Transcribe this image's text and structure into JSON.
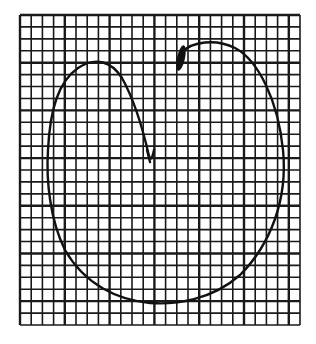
{
  "figure": {
    "type": "hand-drawn closed loop on grid paper",
    "background_color": "#ffffff",
    "ink_color": "#111111",
    "grid_color": "#1a1a1a"
  },
  "grid": {
    "left": 20,
    "top": 15,
    "right": 300,
    "bottom": 325,
    "columns": 25,
    "rows": 26,
    "line_width": 1.6,
    "heavy_line_width": 2.4,
    "heavy_every": 4
  },
  "curve": {
    "stroke_width": 2.4,
    "start_blot": {
      "x": 181,
      "y": 58,
      "rx": 4,
      "ry": 13
    },
    "end_mark": {
      "x": 149,
      "y": 158
    },
    "path": "M 182 52 C 192 42, 215 38, 235 48 C 258 60, 278 100, 283 150 C 288 200, 270 245, 240 275 C 212 300, 175 305, 150 303 C 118 300, 85 285, 65 250 C 50 220, 46 180, 48 150 C 50 110, 58 82, 78 68 C 96 56, 112 62, 122 78 C 132 96, 142 125, 149 156",
    "hook_path": "M 149 156 C 150 160, 152 160, 154 150 M 147 150 L 150 162"
  }
}
